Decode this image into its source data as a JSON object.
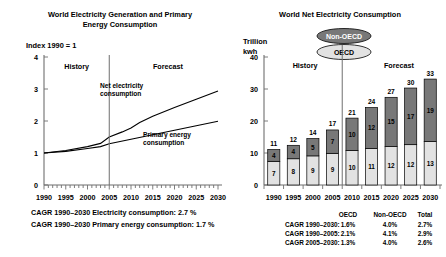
{
  "figure": {
    "background": "#ffffff",
    "accent_dark": "#787878",
    "accent_light": "#e2e2e2"
  },
  "left_panel": {
    "title_line1": "World Electricity Generation and Primary",
    "title_line2": "Energy Consumption",
    "y_axis_caption": "Index 1990 = 1",
    "era_history": "History",
    "era_forecast": "Forecast",
    "series_label_1_line1": "Net electricity",
    "series_label_1_line2": "consumption",
    "series_label_2_line1": "Primary energy",
    "series_label_2_line2": "consumption",
    "footnote_1": "CAGR 1990–2030 Electricity consumption: 2.7 %",
    "footnote_2": "CAGR 1990–2030 Primary energy consumption: 1.7 %"
  },
  "right_panel": {
    "title": "World Net Electricity Consumption",
    "y_axis_caption_line1": "Trillion",
    "y_axis_caption_line2": "kwh",
    "era_history": "History",
    "era_forecast": "Forecast",
    "legend": [
      {
        "label": "Non-OECD",
        "fill": "#787878",
        "text_color": "#ffffff"
      },
      {
        "label": "OECD",
        "fill": "#e2e2e2",
        "text_color": "#000000"
      }
    ],
    "cagr_table": {
      "columns": [
        "OECD",
        "Non-OECD",
        "Total"
      ],
      "rows": [
        {
          "label": "CAGR 1990–2030:",
          "values": [
            "1.6%",
            "4.0%",
            "2.7%"
          ]
        },
        {
          "label": "CAGR 1990–2005:",
          "values": [
            "2.1%",
            "4.1%",
            "2.9%"
          ]
        },
        {
          "label": "CAGR 2005–2030:",
          "values": [
            "1.3%",
            "4.0%",
            "2.6%"
          ]
        }
      ]
    }
  },
  "chart_data": [
    {
      "type": "line",
      "title": "World Electricity Generation and Primary Energy Consumption",
      "xlabel": "",
      "ylabel": "Index 1990 = 1",
      "xlim": [
        1990,
        2030
      ],
      "ylim": [
        0,
        4
      ],
      "yticks": [
        0,
        1,
        2,
        3,
        4
      ],
      "xticks": [
        1990,
        1995,
        2000,
        2005,
        2010,
        2015,
        2020,
        2025,
        2030
      ],
      "minor_tick_step": 1,
      "grid": false,
      "history_forecast_split": 2005,
      "annotations": [
        {
          "text": "History",
          "x": 1997.5,
          "y": 3.62
        },
        {
          "text": "Forecast",
          "x": 2018.5,
          "y": 3.62
        },
        {
          "text": "Net electricity consumption",
          "x": 2009.5,
          "y": 2.82
        },
        {
          "text": "Primary energy consumption",
          "x": 2021.0,
          "y": 1.52
        }
      ],
      "series": [
        {
          "name": "Net electricity consumption",
          "x": [
            1990,
            1995,
            2000,
            2003,
            2005,
            2008,
            2010,
            2012,
            2015,
            2020,
            2025,
            2030
          ],
          "values": [
            1.0,
            1.08,
            1.2,
            1.3,
            1.5,
            1.66,
            1.78,
            1.95,
            2.15,
            2.42,
            2.68,
            2.94
          ]
        },
        {
          "name": "Primary energy consumption",
          "x": [
            1990,
            1995,
            2000,
            2003,
            2005,
            2010,
            2015,
            2020,
            2025,
            2030
          ],
          "values": [
            1.0,
            1.05,
            1.14,
            1.2,
            1.29,
            1.43,
            1.57,
            1.71,
            1.85,
            1.99
          ]
        }
      ],
      "footnotes": [
        "CAGR 1990–2030 Electricity consumption: 2.7 %",
        "CAGR 1990–2030 Primary energy consumption: 1.7 %"
      ]
    },
    {
      "type": "bar",
      "stacked": true,
      "title": "World Net Electricity Consumption",
      "xlabel": "",
      "ylabel": "Trillion kwh",
      "ylim": [
        0,
        40
      ],
      "yticks": [
        0,
        10,
        20,
        30,
        40
      ],
      "categories": [
        "1990",
        "1995",
        "2000",
        "2005",
        "2010",
        "2015",
        "2020",
        "2025",
        "2030"
      ],
      "grid": false,
      "history_forecast_split_index": 4,
      "series": [
        {
          "name": "OECD",
          "fill": "#e2e2e2",
          "values": [
            7.4,
            8.2,
            9.1,
            9.9,
            10.8,
            11.4,
            12.0,
            12.6,
            13.6
          ],
          "labels": [
            "7",
            "8",
            "9",
            "9",
            "10",
            "11",
            "12",
            "12",
            "13"
          ]
        },
        {
          "name": "Non-OECD",
          "fill": "#787878",
          "values": [
            3.7,
            4.2,
            5.4,
            7.3,
            10.1,
            12.8,
            15.4,
            17.7,
            19.5
          ],
          "labels": [
            "4",
            "4",
            "5",
            "7",
            "10",
            "12",
            "15",
            "17",
            "19"
          ]
        }
      ],
      "totals": [
        "11",
        "12",
        "14",
        "17",
        "21",
        "24",
        "27",
        "30",
        "33"
      ],
      "total_values": [
        11.1,
        12.4,
        14.5,
        17.2,
        20.9,
        24.2,
        27.4,
        30.3,
        33.1
      ],
      "annotations": [
        {
          "text": "History",
          "x_index": 1.6,
          "y": 36.5
        },
        {
          "text": "Forecast",
          "x_index": 6.4,
          "y": 36.5
        }
      ]
    }
  ]
}
